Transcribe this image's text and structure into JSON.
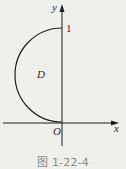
{
  "figure": {
    "axes": {
      "x_label": "x",
      "y_label": "y",
      "origin_label": "O",
      "y_tick_label": "1"
    },
    "region_label": "D",
    "curve": "left semicircle from O(0,0) to (0,1)",
    "caption": "图 1-22-4",
    "colors": {
      "background": "#efefeb",
      "stroke": "#1e1e1e",
      "caption": "#8a8a86"
    }
  }
}
